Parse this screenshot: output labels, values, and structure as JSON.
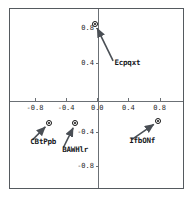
{
  "figure": {
    "background_color": "#ffffff",
    "frame_color": "#555a5f",
    "axis_color": "#6b7075",
    "marker_color": "#111111",
    "label_color": "#15181b"
  },
  "chart_data": {
    "type": "scatter",
    "title": "",
    "xlabel": "",
    "ylabel": "",
    "xlim": [
      -1.12,
      1.1
    ],
    "ylim": [
      -1.05,
      1.02
    ],
    "grid": false,
    "legend_position": "none",
    "axes_style": "crosshair-at-origin",
    "xticks": [
      -0.8,
      -0.4,
      0.0,
      0.4,
      0.8
    ],
    "xticklabels": [
      "-0.8",
      "-0.4",
      "0.0",
      "0.4",
      "0.8"
    ],
    "yticks": [
      -0.8,
      -0.4,
      0.4,
      0.8
    ],
    "yticklabels": [
      "-0.8",
      "-0.4",
      "0.4",
      "0.8"
    ],
    "points": [
      {
        "label": "Ecpqxt",
        "x": -0.03,
        "y": 0.85,
        "label_x": 0.22,
        "label_y": 0.39
      },
      {
        "label": "CBtPpb",
        "x": -0.62,
        "y": -0.3,
        "label_x": -0.86,
        "label_y": -0.52
      },
      {
        "label": "BAWHlr",
        "x": -0.28,
        "y": -0.3,
        "label_x": -0.45,
        "label_y": -0.61
      },
      {
        "label": "IfbONf",
        "x": 0.78,
        "y": -0.28,
        "label_x": 0.41,
        "label_y": -0.51
      }
    ],
    "annotations": [
      {
        "from_label": "Ecpqxt",
        "style": "arrow-to-point"
      },
      {
        "from_label": "CBtPpb",
        "style": "arrow-to-point"
      },
      {
        "from_label": "BAWHlr",
        "style": "arrow-to-point"
      },
      {
        "from_label": "IfbONf",
        "style": "arrow-to-point"
      }
    ]
  }
}
